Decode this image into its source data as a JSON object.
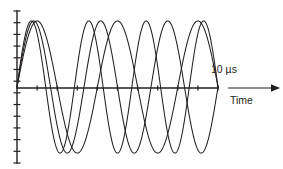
{
  "figure": {
    "name": "sine-waves-time-plot",
    "background_color": "#ffffff",
    "ink_color": "#231f20"
  },
  "labels": {
    "duration": "10 µs",
    "time_axis": "Time"
  },
  "icons": {
    "time_arrow": "arrow-right-icon"
  },
  "axes": {
    "x": {
      "label": "Time",
      "origin_px": [
        17,
        88
      ],
      "end_px": [
        218,
        88
      ],
      "tick_count": 10,
      "tick_length_px": 5,
      "range_us": [
        0,
        10
      ],
      "end_label": "10 µs"
    },
    "y": {
      "label": "",
      "top_px": 11,
      "bottom_px": 163,
      "tick_count": 13,
      "tick_length_px": 7,
      "range": [
        -1.15,
        1.15
      ]
    }
  },
  "chart_data": {
    "type": "line",
    "title": "",
    "subtitle": "",
    "xlabel": "Time",
    "ylabel": "",
    "xlim": [
      0,
      10
    ],
    "ylim": [
      -1.15,
      1.15
    ],
    "x_unit": "µs",
    "grid": false,
    "legend": "none",
    "annotations": [
      {
        "text": "10 µs",
        "x": 10,
        "y": 1.0
      },
      {
        "text": "Time",
        "x": 11.8,
        "y": -0.2
      }
    ],
    "x_ticks": [
      0,
      1,
      2,
      3,
      4,
      5,
      6,
      7,
      8,
      9,
      10
    ],
    "x_tick_labels": [
      "",
      "",
      "",
      "",
      "",
      "",
      "",
      "",
      "",
      "",
      "10 µs"
    ],
    "series": [
      {
        "name": "wave-1",
        "form": "sine",
        "cycles_over_window": 2.5,
        "frequency_khz": 250,
        "amplitude": 1.0,
        "phase_deg": 0,
        "color": "#231f20"
      },
      {
        "name": "wave-2",
        "form": "sine",
        "cycles_over_window": 3.0,
        "frequency_khz": 300,
        "amplitude": 1.0,
        "phase_deg": 0,
        "color": "#231f20"
      },
      {
        "name": "wave-3",
        "form": "sine",
        "cycles_over_window": 3.5,
        "frequency_khz": 350,
        "amplitude": 1.0,
        "phase_deg": 0,
        "color": "#231f20"
      }
    ]
  }
}
